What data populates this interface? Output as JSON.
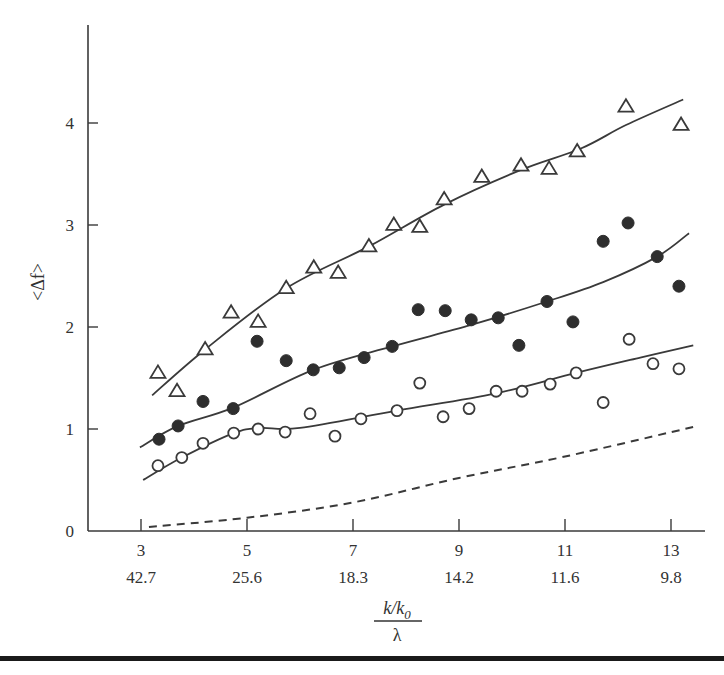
{
  "chart_data": {
    "type": "scatter",
    "title": "",
    "xlabel": "k/k0 over λ",
    "xlabel_numerator": "k/k",
    "xlabel_subscript": "0",
    "xlabel_denominator": "λ",
    "ylabel": "<Δf>",
    "xlim": [
      2.5,
      13.8
    ],
    "ylim": [
      0,
      4.9
    ],
    "grid": false,
    "legend": null,
    "x_ticks": [
      3,
      5,
      7,
      9,
      11,
      13
    ],
    "x_tick_labels_primary": [
      "3",
      "5",
      "7",
      "9",
      "11",
      "13"
    ],
    "x_tick_labels_secondary": [
      "42.7",
      "25.6",
      "18.3",
      "14.2",
      "11.6",
      "9.8"
    ],
    "y_ticks": [
      0,
      1,
      2,
      3,
      4
    ],
    "y_tick_labels": [
      "0",
      "1",
      "2",
      "3",
      "4"
    ],
    "series": [
      {
        "name": "open-triangles",
        "marker": "triangle-open",
        "points": [
          [
            3.32,
            1.55
          ],
          [
            3.68,
            1.37
          ],
          [
            4.21,
            1.78
          ],
          [
            4.7,
            2.14
          ],
          [
            5.21,
            2.05
          ],
          [
            5.74,
            2.38
          ],
          [
            6.26,
            2.58
          ],
          [
            6.72,
            2.53
          ],
          [
            7.3,
            2.79
          ],
          [
            7.77,
            3.0
          ],
          [
            8.26,
            2.98
          ],
          [
            8.72,
            3.25
          ],
          [
            9.43,
            3.47
          ],
          [
            10.17,
            3.58
          ],
          [
            10.7,
            3.55
          ],
          [
            11.23,
            3.72
          ],
          [
            12.15,
            4.16
          ],
          [
            13.19,
            3.98
          ]
        ],
        "fit_curve": [
          [
            3.21,
            1.33
          ],
          [
            4.21,
            1.78
          ],
          [
            5.74,
            2.38
          ],
          [
            7.3,
            2.79
          ],
          [
            8.72,
            3.2
          ],
          [
            10.17,
            3.54
          ],
          [
            11.3,
            3.75
          ],
          [
            12.15,
            3.98
          ],
          [
            13.23,
            4.23
          ]
        ]
      },
      {
        "name": "filled-circles",
        "marker": "circle-filled",
        "points": [
          [
            3.34,
            0.9
          ],
          [
            3.7,
            1.03
          ],
          [
            4.17,
            1.27
          ],
          [
            4.74,
            1.2
          ],
          [
            5.19,
            1.86
          ],
          [
            5.74,
            1.67
          ],
          [
            6.25,
            1.58
          ],
          [
            6.74,
            1.6
          ],
          [
            7.21,
            1.7
          ],
          [
            7.74,
            1.81
          ],
          [
            8.23,
            2.17
          ],
          [
            8.74,
            2.16
          ],
          [
            9.23,
            2.07
          ],
          [
            9.74,
            2.09
          ],
          [
            10.13,
            1.82
          ],
          [
            10.66,
            2.25
          ],
          [
            11.15,
            2.05
          ],
          [
            11.72,
            2.84
          ],
          [
            12.19,
            3.02
          ],
          [
            12.74,
            2.69
          ],
          [
            13.15,
            2.4
          ]
        ],
        "fit_curve": [
          [
            2.98,
            0.82
          ],
          [
            3.7,
            1.03
          ],
          [
            4.74,
            1.21
          ],
          [
            6.25,
            1.58
          ],
          [
            7.74,
            1.81
          ],
          [
            9.23,
            2.02
          ],
          [
            10.66,
            2.25
          ],
          [
            11.72,
            2.44
          ],
          [
            12.74,
            2.69
          ],
          [
            13.34,
            2.92
          ]
        ]
      },
      {
        "name": "open-circles",
        "marker": "circle-open",
        "points": [
          [
            3.32,
            0.64
          ],
          [
            3.77,
            0.72
          ],
          [
            4.17,
            0.86
          ],
          [
            4.75,
            0.96
          ],
          [
            5.21,
            1.0
          ],
          [
            5.72,
            0.97
          ],
          [
            6.19,
            1.15
          ],
          [
            6.66,
            0.93
          ],
          [
            7.15,
            1.1
          ],
          [
            7.83,
            1.18
          ],
          [
            8.26,
            1.45
          ],
          [
            8.7,
            1.12
          ],
          [
            9.19,
            1.2
          ],
          [
            9.7,
            1.37
          ],
          [
            10.19,
            1.37
          ],
          [
            10.72,
            1.44
          ],
          [
            11.21,
            1.55
          ],
          [
            11.72,
            1.26
          ],
          [
            12.21,
            1.88
          ],
          [
            12.66,
            1.64
          ],
          [
            13.15,
            1.59
          ]
        ],
        "fit_curve": [
          [
            3.04,
            0.5
          ],
          [
            3.77,
            0.72
          ],
          [
            4.75,
            0.96
          ],
          [
            5.25,
            1.01
          ],
          [
            6.0,
            1.01
          ],
          [
            7.83,
            1.18
          ],
          [
            9.7,
            1.35
          ],
          [
            11.21,
            1.55
          ],
          [
            12.42,
            1.7
          ],
          [
            13.42,
            1.82
          ]
        ]
      },
      {
        "name": "dashed-reference",
        "marker": "none",
        "line_style": "dashed",
        "fit_curve": [
          [
            3.15,
            0.04
          ],
          [
            5.0,
            0.13
          ],
          [
            7.0,
            0.28
          ],
          [
            9.0,
            0.52
          ],
          [
            11.0,
            0.73
          ],
          [
            13.42,
            1.02
          ]
        ]
      }
    ]
  },
  "layout": {
    "plot_origin_px": [
      141,
      531
    ],
    "x_px_per_unit": 53,
    "y_px_per_unit": 102,
    "y_axis_x_px": 88,
    "y_axis_top_px": 25,
    "x_axis_right_px": 705,
    "x_first_value": 3
  },
  "colors": {
    "ink": "#3a3a3a",
    "marker_fill": "#2e2e2e",
    "background": "#ffffff",
    "rule": "#1a1a1a"
  }
}
